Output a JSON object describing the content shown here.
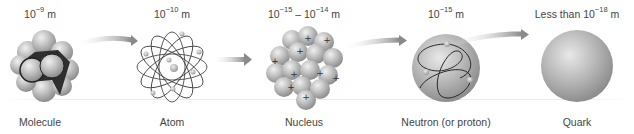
{
  "stages": [
    {
      "name": "Molecule",
      "scale_base": "10",
      "scale_exp": "−9",
      "scale_unit": "m",
      "x": 40
    },
    {
      "name": "Atom",
      "scale_base": "10",
      "scale_exp": "−10",
      "scale_unit": "m",
      "x": 172
    },
    {
      "name": "Nucleus",
      "scale_prefix": "",
      "scale_base": "10",
      "scale_exp": "−15",
      "scale_sep": " – ",
      "scale_base2": "10",
      "scale_exp2": "−14",
      "scale_unit": "m",
      "x": 304
    },
    {
      "name": "Neutron (or proton)",
      "scale_base": "10",
      "scale_exp": "−15",
      "scale_unit": "m",
      "x": 446
    },
    {
      "name": "Quark",
      "scale_prefix": "Less than ",
      "scale_base": "10",
      "scale_exp": "−18",
      "scale_unit": "m",
      "x": 577
    }
  ],
  "arrows": [
    {
      "from": "Molecule",
      "to": "Atom"
    },
    {
      "from": "Atom",
      "to": "Nucleus"
    },
    {
      "from": "Nucleus",
      "to": "Neutron (or proton)"
    },
    {
      "from": "Neutron (or proton)",
      "to": "Quark"
    }
  ],
  "nucleus_symbol": "+",
  "colors": {
    "arrow": "#8c8c8c",
    "sphere": "#b5b5b5",
    "sphere_dark": "#7a7a7a",
    "orbit": "#333333",
    "text": "#444444"
  }
}
